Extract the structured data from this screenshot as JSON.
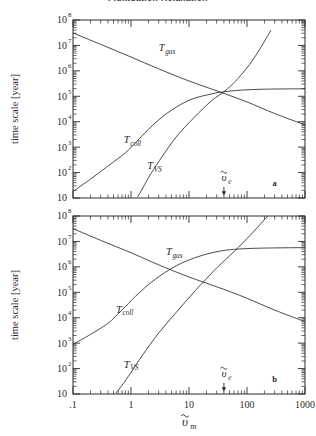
{
  "figure": {
    "title_partial": "Fluktuation Relaxation",
    "panels": [
      {
        "id": "a",
        "label": "a",
        "ylabel": "time scale [year]",
        "curve_labels": {
          "gas": "T_gas",
          "coll": "T_coll",
          "vs": "T_VS"
        },
        "marker_label": "ve"
      },
      {
        "id": "b",
        "label": "b",
        "ylabel": "time scale [year]",
        "curve_labels": {
          "gas": "T_gas",
          "coll": "T_coll",
          "vs": "T_VS"
        },
        "marker_label": "ve"
      }
    ],
    "xlabel": "vm",
    "ytick_labels": [
      "10",
      "10",
      "10",
      "10",
      "10",
      "10",
      "10",
      "10"
    ],
    "ytick_exponents": [
      "",
      "2",
      "3",
      "4",
      "5",
      "6",
      "7",
      "8"
    ],
    "xtick_labels": [
      ".1",
      "1",
      "10",
      "100",
      "1000"
    ]
  },
  "chart_data": [
    {
      "type": "line",
      "panel": "a",
      "title": "",
      "xlabel": "vm",
      "ylabel": "time scale [year]",
      "xscale": "log",
      "yscale": "log",
      "xlim": [
        0.1,
        1000
      ],
      "ylim": [
        10,
        100000000
      ],
      "xticks": [
        0.1,
        1,
        10,
        100,
        1000
      ],
      "yticks": [
        10,
        100,
        1000,
        10000,
        100000,
        1000000,
        10000000,
        100000000
      ],
      "grid": false,
      "legend": "inline-labels",
      "annotations": [
        {
          "text": "ve",
          "x": 40,
          "y": 30,
          "arrow": "down"
        },
        {
          "text": "a",
          "x": 300,
          "y": 30
        }
      ],
      "series": [
        {
          "name": "T_gas",
          "label_x": 3.0,
          "label_y": 6000000,
          "x": [
            0.1,
            0.3,
            1,
            3,
            10,
            40,
            100,
            300,
            1000
          ],
          "y": [
            31000000,
            11000000,
            3500000,
            1200000,
            400000,
            130000,
            60000,
            21000,
            7500
          ]
        },
        {
          "name": "T_coll",
          "label_x": 0.75,
          "label_y": 1400,
          "x": [
            0.1,
            0.2,
            0.4,
            0.8,
            1.2,
            2,
            4,
            10,
            25,
            40,
            80,
            200,
            500,
            1000
          ],
          "y": [
            18,
            55,
            180,
            600,
            1500,
            5000,
            20000,
            70000,
            125000,
            150000,
            175000,
            190000,
            195000,
            197000
          ]
        },
        {
          "name": "T_VS",
          "label_x": 1.9,
          "label_y": 140,
          "x": [
            1.3,
            1.6,
            2.2,
            3.5,
            6,
            12,
            25,
            40,
            70,
            130,
            260
          ],
          "y": [
            11,
            25,
            90,
            450,
            2500,
            14000,
            70000,
            150000,
            500000,
            3000000,
            40000000
          ]
        }
      ]
    },
    {
      "type": "line",
      "panel": "b",
      "title": "",
      "xlabel": "vm",
      "ylabel": "time scale [year]",
      "xscale": "log",
      "yscale": "log",
      "xlim": [
        0.1,
        1000
      ],
      "ylim": [
        10,
        100000000
      ],
      "xticks": [
        0.1,
        1,
        10,
        100,
        1000
      ],
      "yticks": [
        10,
        100,
        1000,
        10000,
        100000,
        1000000,
        10000000,
        100000000
      ],
      "grid": false,
      "legend": "inline-labels",
      "annotations": [
        {
          "text": "ve",
          "x": 40,
          "y": 30,
          "arrow": "down"
        },
        {
          "text": "b",
          "x": 300,
          "y": 30
        }
      ],
      "series": [
        {
          "name": "T_gas",
          "label_x": 4.0,
          "label_y": 2800000,
          "x": [
            0.1,
            0.3,
            1,
            3,
            10,
            40,
            100,
            300,
            1000
          ],
          "y": [
            32000000,
            11000000,
            3600000,
            1200000,
            400000,
            130000,
            58000,
            20000,
            7000
          ]
        },
        {
          "name": "T_coll",
          "label_x": 0.55,
          "label_y": 16000,
          "x": [
            0.1,
            0.2,
            0.4,
            0.7,
            1.2,
            2.5,
            6,
            15,
            35,
            70,
            150,
            400,
            1000
          ],
          "y": [
            900,
            2200,
            6000,
            20000,
            70000,
            300000,
            1100000,
            2600000,
            4200000,
            5000000,
            5400000,
            5600000,
            5700000
          ]
        },
        {
          "name": "T_VS",
          "label_x": 0.75,
          "label_y": 110,
          "x": [
            0.55,
            0.7,
            1,
            1.6,
            3,
            6,
            13,
            30,
            60,
            120,
            300
          ],
          "y": [
            11,
            22,
            70,
            350,
            2500,
            16000,
            120000,
            900000,
            4000000,
            20000000,
            200000000
          ]
        }
      ]
    }
  ]
}
